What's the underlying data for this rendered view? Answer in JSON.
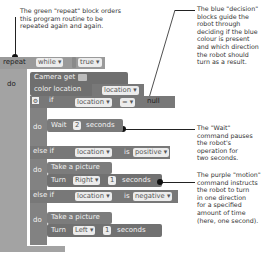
{
  "annotations": {
    "repeat": [
      "The green \"repeat\" block orders",
      "this program routine to be",
      "repeated again and again."
    ],
    "decision": [
      "The blue \"decision\"",
      "blocks guide the",
      "robot through",
      "deciding if the blue",
      "colour is present",
      "and which direction",
      "the robot should",
      "turn as a result."
    ],
    "wait": [
      "The \"Wait\"",
      "command pauses",
      "the robot's",
      "operation for",
      "two seconds."
    ],
    "motion": [
      "The purple \"motion\"",
      "command instructs",
      "the robot to turn",
      "in one direction",
      "for a specified",
      "amount of time",
      "(here, one second)."
    ]
  },
  "program": {
    "repeat": {
      "keyword": "repeat",
      "mode": "while ▾",
      "condition": "true ▾",
      "do": "do"
    },
    "camera": {
      "line1": "Camera get",
      "line2": "color location",
      "var": "location ▾"
    },
    "if_block": {
      "keyword": "if",
      "var": "location ▾",
      "op": "= ▾",
      "value": "null",
      "do": "do"
    },
    "wait": {
      "label": "Wait",
      "value": "2",
      "unit": "seconds"
    },
    "elseif1": {
      "keyword": "else if",
      "var": "location ▾",
      "is": "is",
      "value": "positive ▾",
      "do": "do"
    },
    "action1": {
      "picture": "Take a picture",
      "turn": "Turn",
      "dir": "Right ▾",
      "value": "1",
      "unit": "seconds"
    },
    "elseif2": {
      "keyword": "else if",
      "var": "location ▾",
      "is": "is",
      "value": "negative ▾",
      "do": "do"
    },
    "action2": {
      "picture": "Take a picture",
      "turn": "Turn",
      "dir": "Left ▾",
      "value": "1",
      "unit": "seconds"
    }
  },
  "colors": {
    "repeat": "#9a9a9a",
    "camera": "#6f6f6f",
    "decision": "#787878",
    "action": "#7c7c7c",
    "field": "#ececec"
  }
}
